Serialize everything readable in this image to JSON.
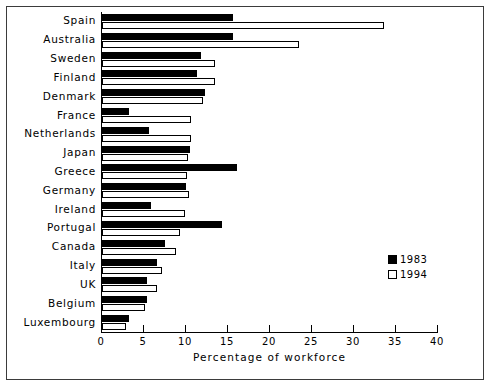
{
  "chart_data": {
    "type": "bar",
    "orientation": "horizontal",
    "title": "",
    "xlabel": "Percentage of workforce",
    "ylabel": "",
    "xlim": [
      0,
      40
    ],
    "xticks": [
      0,
      5,
      10,
      15,
      20,
      25,
      30,
      35,
      40
    ],
    "grid": false,
    "legend_position": "center-right",
    "categories": [
      "Spain",
      "Australia",
      "Sweden",
      "Finland",
      "Denmark",
      "France",
      "Netherlands",
      "Japan",
      "Greece",
      "Germany",
      "Ireland",
      "Portugal",
      "Canada",
      "Italy",
      "UK",
      "Belgium",
      "Luxembourg"
    ],
    "series": [
      {
        "name": "1983",
        "color": "#000000",
        "values": [
          15.6,
          15.6,
          11.8,
          11.3,
          12.3,
          3.2,
          5.6,
          10.5,
          16.1,
          10.0,
          5.8,
          14.3,
          7.5,
          6.5,
          5.4,
          5.3,
          3.2
        ]
      },
      {
        "name": "1994",
        "color": "#ffffff",
        "values": [
          33.6,
          23.5,
          13.4,
          13.4,
          12.0,
          10.6,
          10.6,
          10.2,
          10.1,
          10.4,
          9.9,
          9.3,
          8.8,
          7.2,
          6.5,
          5.1,
          2.9
        ]
      }
    ]
  },
  "legend": {
    "items": [
      {
        "label": "1983",
        "swatch": "filled-black"
      },
      {
        "label": "1994",
        "swatch": "outlined-white"
      }
    ]
  },
  "axis": {
    "x_title": "Percentage of workforce",
    "tick_labels": [
      "0",
      "5",
      "10",
      "15",
      "20",
      "25",
      "30",
      "35",
      "40"
    ]
  }
}
